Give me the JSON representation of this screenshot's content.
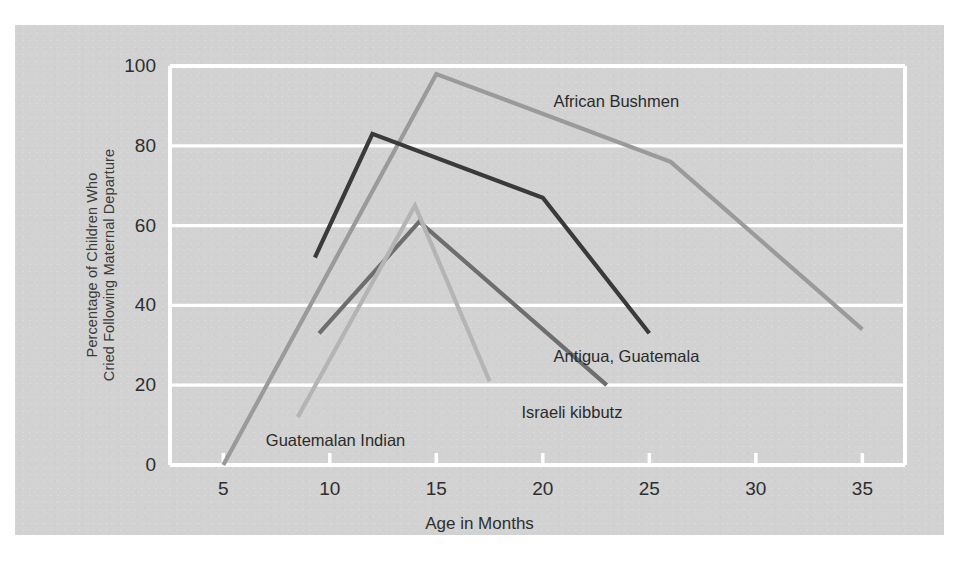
{
  "figure": {
    "panel_color": "#d2d2d2",
    "page_color": "#ffffff",
    "gridline_color": "#ffffff",
    "axis_color": "#ffffff",
    "text_color": "#2e2e2e"
  },
  "axes": {
    "y_label": "Percentage of Children Who Cried Following Maternal Departure",
    "y_label_line1": "Percentage of Children Who",
    "y_label_line2": "Cried Following Maternal Departure",
    "x_label": "Age in Months",
    "y_ticks": [
      "0",
      "20",
      "40",
      "60",
      "80",
      "100"
    ],
    "x_ticks": [
      "5",
      "10",
      "15",
      "20",
      "25",
      "30",
      "35"
    ]
  },
  "chart_data": {
    "type": "line",
    "title": "",
    "subtitle": "",
    "xlabel": "Age in Months",
    "ylabel": "Percentage of Children Who Cried Following Maternal Departure",
    "xlim": [
      2.5,
      37
    ],
    "ylim": [
      0,
      100
    ],
    "xticks": [
      5,
      10,
      15,
      20,
      25,
      30,
      35
    ],
    "yticks": [
      0,
      20,
      40,
      60,
      80,
      100
    ],
    "grid": "horizontal",
    "legend": "inline-annotations",
    "series": [
      {
        "name": "African Bushmen",
        "color": "#9a9a9a",
        "label_x": 20.5,
        "label_y": 91,
        "x": [
          5,
          15,
          26,
          35
        ],
        "y": [
          0,
          98,
          76,
          34
        ]
      },
      {
        "name": "Antigua, Guatemala",
        "color": "#3a3a3a",
        "label_x": 20.5,
        "label_y": 27,
        "x": [
          9.3,
          12,
          20,
          25
        ],
        "y": [
          52,
          83,
          67,
          33
        ]
      },
      {
        "name": "Israeli kibbutz",
        "color": "#6e6e6e",
        "label_x": 19.0,
        "label_y": 13,
        "x": [
          9.5,
          14.2,
          23
        ],
        "y": [
          33,
          61,
          20
        ]
      },
      {
        "name": "Guatemalan Indian",
        "color": "#b4b4b4",
        "label_x": 7.0,
        "label_y": 6,
        "x": [
          8.5,
          14,
          17.5
        ],
        "y": [
          12,
          65,
          21
        ]
      }
    ]
  },
  "annotations": [
    {
      "id": "african-bushmen",
      "text": "African Bushmen"
    },
    {
      "id": "antigua-guatemala",
      "text": "Antigua, Guatemala"
    },
    {
      "id": "israeli-kibbutz",
      "text": "Israeli kibbutz"
    },
    {
      "id": "guatemalan-indian",
      "text": "Guatemalan Indian"
    }
  ]
}
